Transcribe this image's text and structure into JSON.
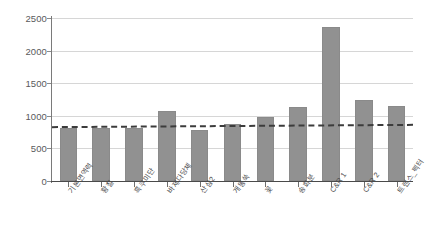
{
  "chart_data": {
    "type": "bar",
    "title": "",
    "subtitle": "",
    "xlabel": "",
    "ylabel": "",
    "ylim": [
      0,
      2500
    ],
    "grid": true,
    "legend": "none",
    "categories": [
      "기본면역력",
      "황칠",
      "흑쿠미단",
      "바제다당체",
      "산삼2",
      "개똥쑥",
      "꽃",
      "송화분",
      "C&R 1",
      "C&R 2",
      "트랜스_펙터"
    ],
    "values": [
      820,
      820,
      820,
      1075,
      790,
      870,
      985,
      1140,
      2365,
      1245,
      1150
    ],
    "ytick_labels": [
      "0",
      "500",
      "1000",
      "1500",
      "2000",
      "2500"
    ],
    "ytick_values": [
      0,
      500,
      1000,
      1500,
      2000,
      2500
    ],
    "series": [
      {
        "name": "value",
        "values": [
          820,
          820,
          820,
          1075,
          790,
          870,
          985,
          1140,
          2365,
          1245,
          1150
        ]
      }
    ],
    "reference_line": {
      "style": "dashed",
      "color": "#3c3c3c",
      "start_value": 845,
      "end_value": 880
    },
    "colors": {
      "bar": "#919191",
      "bar_border": "#8a8a8a",
      "grid": "#d6d6d6",
      "axis": "#4a4a4a",
      "tick_text": "#59595b",
      "category_text": "#4d4d4f",
      "background": "#ffffff"
    }
  }
}
